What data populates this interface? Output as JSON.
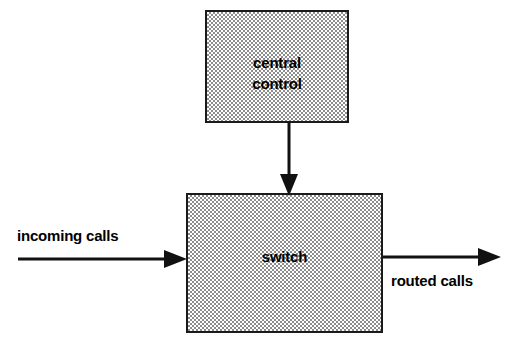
{
  "diagram": {
    "background_color": "#ffffff",
    "line_color": "#111111",
    "fill_pattern_color": "#8d8d8d",
    "nodes": [
      {
        "id": "central-control",
        "label": "central\ncontrol",
        "shape": "rectangle",
        "fill": "stipple-checkerboard",
        "x": 205,
        "y": 10,
        "width": 144,
        "height": 113
      },
      {
        "id": "switch",
        "label": "switch",
        "shape": "rectangle",
        "fill": "stipple-checkerboard",
        "x": 186,
        "y": 193,
        "width": 197,
        "height": 140
      }
    ],
    "edges": [
      {
        "id": "control-to-switch",
        "label": "",
        "from": "central-control",
        "to": "switch",
        "direction": "down"
      },
      {
        "id": "incoming-calls-edge",
        "label": "incoming calls",
        "from": "external",
        "to": "switch",
        "direction": "right"
      },
      {
        "id": "routed-calls-edge",
        "label": "routed calls",
        "from": "switch",
        "to": "external",
        "direction": "right"
      }
    ]
  }
}
